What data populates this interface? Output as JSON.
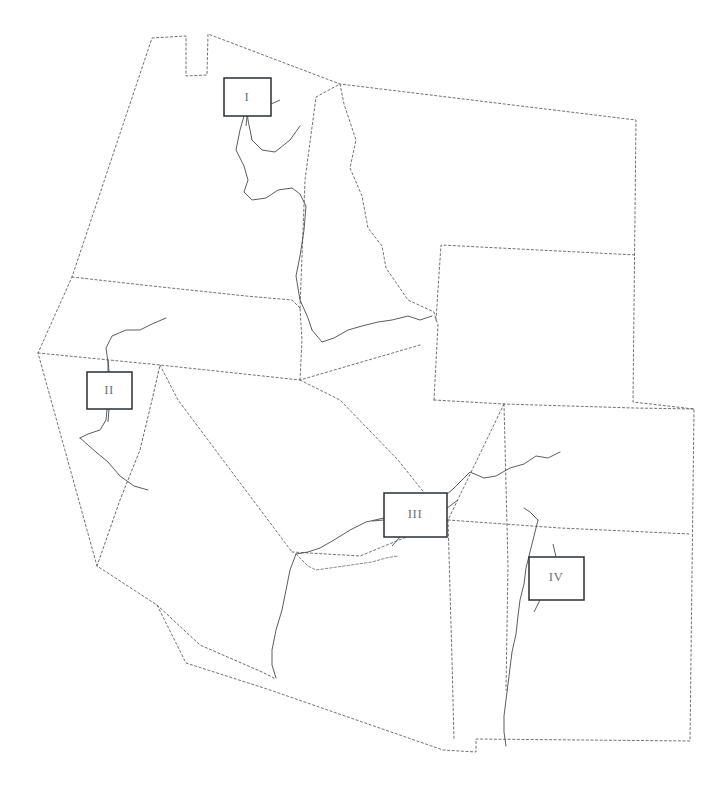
{
  "figure": {
    "kind": "reference-map",
    "region_title": "Western United States",
    "background_color": "#ffffff",
    "boundary_color": "#555a5f",
    "river_color": "#3c4045",
    "label_box_border_color": "#2b2f33",
    "label_text_color": "#6e7378"
  },
  "labels": [
    {
      "id": "label-1",
      "text": "I",
      "box": {
        "x": 224,
        "y": 78,
        "w": 47,
        "h": 38
      },
      "text_x": 247,
      "text_y": 98
    },
    {
      "id": "label-2",
      "text": "II",
      "box": {
        "x": 87,
        "y": 372,
        "w": 45,
        "h": 37
      },
      "text_x": 109,
      "text_y": 391
    },
    {
      "id": "label-3",
      "text": "III",
      "box": {
        "x": 384,
        "y": 493,
        "w": 63,
        "h": 44
      },
      "text_x": 415,
      "text_y": 515
    },
    {
      "id": "label-4",
      "text": "IV",
      "box": {
        "x": 529,
        "y": 557,
        "w": 55,
        "h": 43
      },
      "text_x": 556,
      "text_y": 578
    }
  ],
  "states": [
    {
      "id": "washington",
      "name": "Washington"
    },
    {
      "id": "oregon",
      "name": "Oregon"
    },
    {
      "id": "idaho",
      "name": "Idaho"
    },
    {
      "id": "montana",
      "name": "Montana"
    },
    {
      "id": "wyoming",
      "name": "Wyoming"
    },
    {
      "id": "california",
      "name": "California"
    },
    {
      "id": "nevada",
      "name": "Nevada"
    },
    {
      "id": "utah",
      "name": "Utah"
    },
    {
      "id": "colorado",
      "name": "Colorado"
    },
    {
      "id": "arizona",
      "name": "Arizona"
    },
    {
      "id": "new-mexico",
      "name": "New Mexico"
    }
  ],
  "rivers": [
    {
      "id": "river-columbia",
      "label_ref": "I"
    },
    {
      "id": "river-sacramento",
      "label_ref": "II"
    },
    {
      "id": "river-colorado",
      "label_ref": "III"
    },
    {
      "id": "river-rio-grande",
      "label_ref": "IV"
    }
  ],
  "geometry": {
    "outer_boundary": "M 152 38 L 186 36 L 186 76 L 207 75 L 208 34 L 340 84 L 636 120 L 633 402 L 694 409 L 690 741 L 476 739 L 476 752 L 443 750 L 270 690 L 186 663 L 157 605 L 97 566 L 38 353 L 72 277 Z",
    "wa_south": "M 72 277 L 152 286 L 246 296 L 292 300 L 300 308",
    "or_south": "M 38 353 L 160 365 L 300 380 L 420 345",
    "wa_id_border": "M 300 308 L 305 180 L 316 97 L 340 84",
    "or_id_border": "M 300 380 L 302 340 L 300 308",
    "id_mt_border": "M 340 84 L 344 104 L 356 140 L 350 168 L 362 196 L 368 228 L 382 246 L 386 268 L 408 300 L 434 312 L 436 320",
    "mt_wy_border": "M 436 320 L 441 245 L 636 255",
    "id_nv_ut_border": "M 300 380 L 340 400 L 398 460 L 430 500 L 448 520",
    "wy_south_border": "M 434 400 L 504 404 L 634 408 L 694 409",
    "nv_ut_border": "M 434 400 L 438 324 L 436 320",
    "ca_nv_border": "M 160 365 L 178 400 L 292 552",
    "ut_co_border": "M 504 404 L 508 566 L 506 690",
    "az_nm_border": "M 448 520 L 452 660 L 454 740",
    "az_ut_border": "M 292 552 L 360 556 L 448 520 L 504 404",
    "nm_co_border": "M 448 520 L 560 528 L 690 534",
    "ca_coast": "M 97 566 L 120 500 L 140 450 L 152 400 L 160 365",
    "ca_south_coast": "M 157 605 L 200 645 L 262 672 L 274 678",
    "columbia_river": "M 300 126 L 290 140 L 275 152 L 262 150 L 252 140 L 248 120 L 247 110 L 244 116 L 240 130 L 236 150 L 244 166 L 248 180 L 244 192 L 252 200 L 266 198 L 278 190 L 292 188 L 300 194 L 306 206 L 304 230 L 300 256 L 296 276 L 300 300 L 308 318 L 312 330",
    "snake_river": "M 312 330 L 322 342 L 334 338 L 348 330 L 362 326 L 378 322 L 392 320 L 408 316 L 420 320 L 432 316",
    "sacramento_river": "M 166 318 L 152 324 L 140 330 L 126 330 L 112 336 L 106 348 L 108 362 L 108 380 L 108 400 L 106 420 L 100 430 L 88 434 L 80 438",
    "sacramento_branch": "M 80 438 L 96 452 L 108 462 L 120 476 L 134 486 L 148 490",
    "colorado_river_upper": "M 560 452 L 548 458 L 536 456 L 524 464 L 510 468 L 496 476 L 484 478 L 470 472 L 462 480 L 452 490 L 442 498 L 430 506 L 418 512",
    "colorado_river_mid": "M 384 518 L 366 522 L 350 530 L 334 540 L 320 548 L 308 552 L 296 554",
    "colorado_river_lower": "M 296 554 L 290 570 L 286 590 L 282 610 L 276 630 L 272 650 L 272 665 L 276 678",
    "colorado_river_az": "M 296 554 L 302 560 L 308 566 L 316 570 L 330 568 L 344 566 L 358 564 L 372 562 L 386 558 L 398 556",
    "rio_grande": "M 538 520 L 534 536 L 530 552 L 526 568 L 524 584 L 520 600 L 518 616 L 516 634 L 512 652 L 510 668 L 508 684 L 506 700 L 504 716 L 504 732 L 506 746",
    "rio_grande_upper": "M 524 508 L 530 512 L 538 520",
    "leader_1_down": "M 247 116 L 246 126",
    "leader_1_right": "M 271 104 L 280 100",
    "leader_2_up": "M 109 372 L 108 360",
    "leader_2_down": "M 109 409 L 108 422",
    "leader_3_left": "M 384 520 L 372 521",
    "leader_3_right": "M 447 508 L 458 500",
    "leader_3_down": "M 400 537 L 392 546",
    "leader_4_up": "M 556 557 L 553 544",
    "leader_4_down": "M 540 600 L 534 612"
  }
}
